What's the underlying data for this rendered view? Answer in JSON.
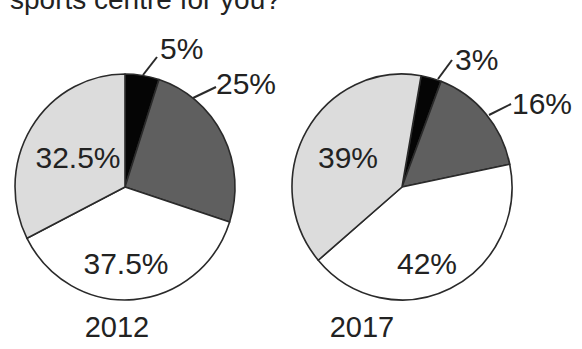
{
  "title": "sports centre for you?",
  "colors": {
    "black": "#050505",
    "dark_gray": "#5f5f5f",
    "white": "#ffffff",
    "light_gray": "#dcdcdc",
    "stroke": "#2a2a2a",
    "text": "#222222"
  },
  "chart_data": [
    {
      "type": "pie",
      "title": "2012",
      "start_angle_deg": 0,
      "direction": "clockwise",
      "slices": [
        {
          "label": "5%",
          "value": 5,
          "color": "#050505",
          "label_position": "outside"
        },
        {
          "label": "25%",
          "value": 25,
          "color": "#5f5f5f",
          "label_position": "outside"
        },
        {
          "label": "37.5%",
          "value": 37.5,
          "color": "#ffffff",
          "label_position": "inside"
        },
        {
          "label": "32.5%",
          "value": 32.5,
          "color": "#dcdcdc",
          "label_position": "inside"
        }
      ]
    },
    {
      "type": "pie",
      "title": "2017",
      "start_angle_deg": 10,
      "direction": "clockwise",
      "slices": [
        {
          "label": "3%",
          "value": 3,
          "color": "#050505",
          "label_position": "outside"
        },
        {
          "label": "16%",
          "value": 16,
          "color": "#5f5f5f",
          "label_position": "outside"
        },
        {
          "label": "42%",
          "value": 42,
          "color": "#ffffff",
          "label_position": "inside"
        },
        {
          "label": "39%",
          "value": 39,
          "color": "#dcdcdc",
          "label_position": "inside"
        }
      ]
    }
  ],
  "layout": {
    "pies": [
      {
        "cx": 125,
        "cy": 187,
        "rx": 110,
        "ry": 113,
        "year_label_pos": [
          117,
          337
        ],
        "labels": [
          {
            "x": 160,
            "y": 59,
            "anchor": "start",
            "leader": [
              143,
              75,
              157,
              57
            ]
          },
          {
            "x": 216,
            "y": 94,
            "anchor": "start",
            "leader": [
              193,
              98,
              216,
              87
            ]
          },
          {
            "x": 126,
            "y": 274,
            "anchor": "middle",
            "leader": null
          },
          {
            "x": 78,
            "y": 168,
            "anchor": "middle",
            "leader": null
          }
        ]
      },
      {
        "cx": 402,
        "cy": 187,
        "rx": 110,
        "ry": 113,
        "year_label_pos": [
          362,
          337
        ],
        "labels": [
          {
            "x": 455,
            "y": 70,
            "anchor": "start",
            "leader": [
              438,
              79,
              452,
              60
            ]
          },
          {
            "x": 512,
            "y": 114,
            "anchor": "start",
            "leader": [
              489,
              115,
              511,
              104
            ]
          },
          {
            "x": 427,
            "y": 274,
            "anchor": "middle",
            "leader": null
          },
          {
            "x": 348,
            "y": 168,
            "anchor": "middle",
            "leader": null
          }
        ]
      }
    ]
  }
}
